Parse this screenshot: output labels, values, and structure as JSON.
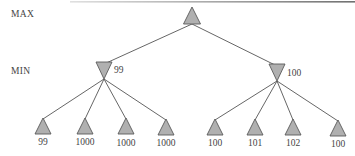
{
  "diagram": {
    "type": "game-tree",
    "levels": [
      {
        "label": "MAX"
      },
      {
        "label": "MIN"
      }
    ],
    "root": {
      "player": "MAX"
    },
    "min_nodes": [
      {
        "value": "99",
        "leaves": [
          "99",
          "1000",
          "1000",
          "1000"
        ]
      },
      {
        "value": "100",
        "leaves": [
          "100",
          "101",
          "102",
          "100"
        ]
      }
    ],
    "colors": {
      "node_fill": "#b0b0b0",
      "node_stroke": "#5a5a5a",
      "edge": "#555555",
      "text": "#444444"
    }
  }
}
